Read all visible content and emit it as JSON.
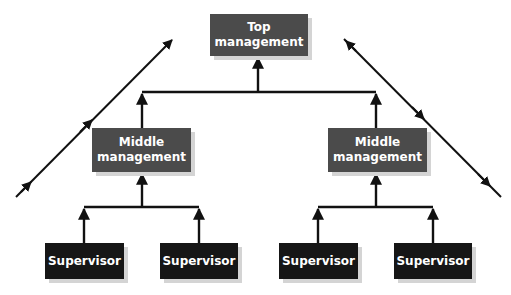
{
  "colors": {
    "management_box": "#4b4b4b",
    "supervisor_box": "#161616",
    "box_text": "#ffffff",
    "connector": "#111111",
    "shadow": "#d4d4d4"
  },
  "nodes": {
    "top": {
      "line1": "Top",
      "line2": "management"
    },
    "middle_left": {
      "line1": "Middle",
      "line2": "management"
    },
    "middle_right": {
      "line1": "Middle",
      "line2": "management"
    },
    "supervisors": [
      {
        "label": "Supervisor"
      },
      {
        "label": "Supervisor"
      },
      {
        "label": "Supervisor"
      },
      {
        "label": "Supervisor"
      }
    ]
  },
  "edges": [
    {
      "from": "middle_left",
      "to": "top"
    },
    {
      "from": "middle_right",
      "to": "top"
    },
    {
      "from": "supervisors.0",
      "to": "middle_left"
    },
    {
      "from": "supervisors.1",
      "to": "middle_left"
    },
    {
      "from": "supervisors.2",
      "to": "middle_right"
    },
    {
      "from": "supervisors.3",
      "to": "middle_right"
    }
  ],
  "side_arrows": {
    "left": {
      "direction": "upward",
      "arrowheads": 3
    },
    "right": {
      "direction": "downward",
      "arrowheads": 3
    }
  }
}
